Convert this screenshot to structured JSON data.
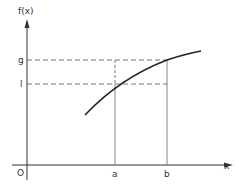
{
  "diagram": {
    "y_axis_label": "f(x)",
    "x_axis_label": "x",
    "origin_label": "O",
    "x_ticks": [
      {
        "label": "a",
        "x": 115
      },
      {
        "label": "b",
        "x": 167
      }
    ],
    "y_ticks": [
      {
        "label": "g",
        "y": 60
      },
      {
        "label": "l",
        "y": 84
      }
    ],
    "colors": {
      "axis": "#333333",
      "curve": "#222222",
      "guide": "#555555"
    }
  }
}
